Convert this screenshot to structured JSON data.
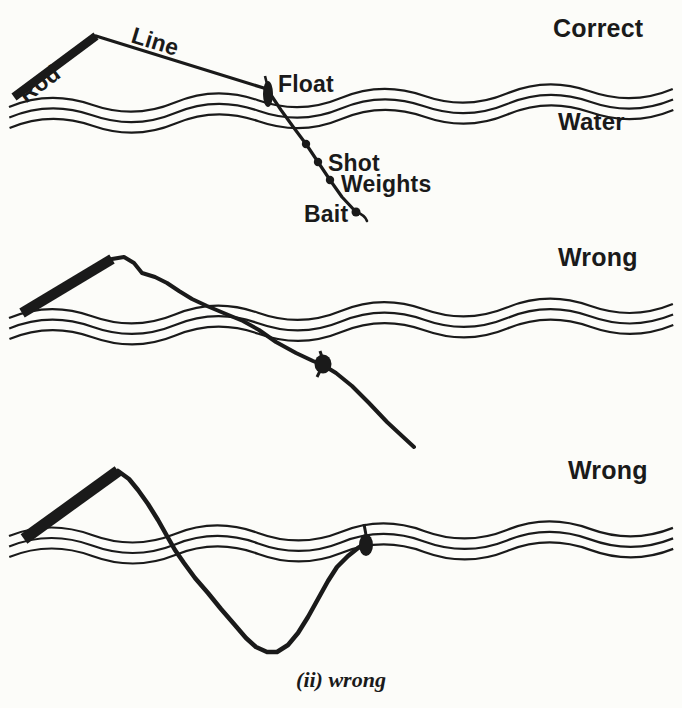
{
  "colors": {
    "ink": "#1a1a1a",
    "paper": "#fcfcf9"
  },
  "caption": "(ii) wrong",
  "panels": [
    {
      "id": "correct-setup",
      "verdict": "Correct",
      "labels": {
        "rod": "Rod",
        "line": "Line",
        "float": "Float",
        "water": "Water",
        "shot": "Shot",
        "weights": "Weights",
        "bait": "Bait"
      }
    },
    {
      "id": "wrong-slack-line",
      "verdict": "Wrong"
    },
    {
      "id": "wrong-sunk-line",
      "verdict": "Wrong"
    }
  ]
}
